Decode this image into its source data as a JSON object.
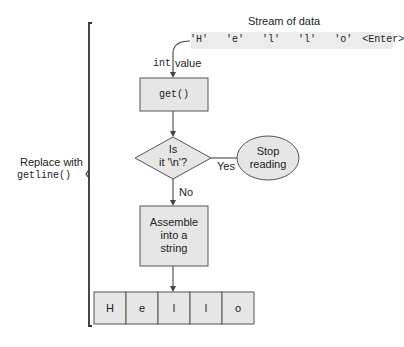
{
  "stream": {
    "title": "Stream of data",
    "chars": [
      "'H'",
      "'e'",
      "'l'",
      "'l'",
      "'o'",
      "<Enter>"
    ]
  },
  "input_label": {
    "type": "int",
    "name": "value"
  },
  "nodes": {
    "get": "get()",
    "decision_line1": "Is",
    "decision_line2": "it '\\n'?",
    "stop_line1": "Stop",
    "stop_line2": "reading",
    "assemble_line1": "Assemble",
    "assemble_line2": "into a",
    "assemble_line3": "string"
  },
  "edges": {
    "yes": "Yes",
    "no": "No"
  },
  "result_cells": [
    "H",
    "e",
    "l",
    "l",
    "o"
  ],
  "bracket_label": {
    "line1": "Replace with",
    "line2": "getline()"
  },
  "colors": {
    "box_fill": "#e6e6e6",
    "stroke": "#555555",
    "stream_bg": "#ebebeb"
  }
}
